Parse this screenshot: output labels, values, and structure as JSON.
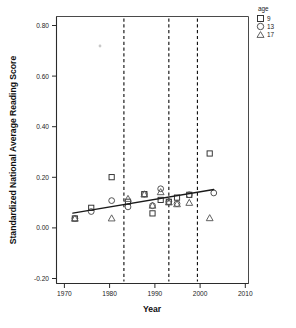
{
  "chart_data": {
    "type": "scatter",
    "title": "",
    "xlabel": "Year",
    "ylabel": "Standardized National Average Reading Score",
    "xlim": [
      1966.5,
      2013.5
    ],
    "ylim": [
      -0.28,
      0.87
    ],
    "xticks": [
      1970,
      1980,
      1990,
      2000,
      2010
    ],
    "xtick_labels": [
      "1970",
      "1980",
      "1990",
      "2000",
      "2010"
    ],
    "yticks": [
      -0.2,
      0.0,
      0.2,
      0.4,
      0.6,
      0.8
    ],
    "ytick_labels": [
      "-0.20",
      "0.00",
      "0.20",
      "0.40",
      "0.60",
      "0.80"
    ],
    "grid": false,
    "legend": {
      "title": "age",
      "position": "top-right-outside",
      "entries": [
        {
          "label": "9",
          "marker": "square"
        },
        {
          "label": "13",
          "marker": "circle"
        },
        {
          "label": "17",
          "marker": "triangle"
        }
      ]
    },
    "reference_lines": {
      "orientation": "vertical",
      "style": "dashed",
      "x": [
        1983,
        1994,
        2001
      ]
    },
    "trend_line": {
      "type": "linear-fit",
      "x": [
        1970.5,
        2005.0
      ],
      "y": [
        0.023,
        0.125
      ]
    },
    "series": [
      {
        "name": "9",
        "marker": "square",
        "points": [
          {
            "x": 1971,
            "y": 0.0
          },
          {
            "x": 1975,
            "y": 0.046
          },
          {
            "x": 1980,
            "y": 0.178
          },
          {
            "x": 1984,
            "y": 0.072
          },
          {
            "x": 1988,
            "y": 0.105
          },
          {
            "x": 1990,
            "y": 0.022
          },
          {
            "x": 1992,
            "y": 0.08
          },
          {
            "x": 1994,
            "y": 0.072
          },
          {
            "x": 1996,
            "y": 0.09
          },
          {
            "x": 1999,
            "y": 0.102
          },
          {
            "x": 2004,
            "y": 0.28
          }
        ]
      },
      {
        "name": "13",
        "marker": "circle",
        "points": [
          {
            "x": 1971,
            "y": 0.0
          },
          {
            "x": 1975,
            "y": 0.03
          },
          {
            "x": 1980,
            "y": 0.077
          },
          {
            "x": 1984,
            "y": 0.05
          },
          {
            "x": 1988,
            "y": 0.105
          },
          {
            "x": 1990,
            "y": 0.055
          },
          {
            "x": 1992,
            "y": 0.128
          },
          {
            "x": 1994,
            "y": 0.072
          },
          {
            "x": 1996,
            "y": 0.064
          },
          {
            "x": 1999,
            "y": 0.102
          },
          {
            "x": 2005,
            "y": 0.11
          }
        ]
      },
      {
        "name": "17",
        "marker": "triangle",
        "points": [
          {
            "x": 1971,
            "y": 0.0
          },
          {
            "x": 1980,
            "y": 0.001
          },
          {
            "x": 1984,
            "y": 0.085
          },
          {
            "x": 1988,
            "y": 0.104
          },
          {
            "x": 1990,
            "y": 0.056
          },
          {
            "x": 1992,
            "y": 0.114
          },
          {
            "x": 1994,
            "y": 0.07
          },
          {
            "x": 1996,
            "y": 0.062
          },
          {
            "x": 1999,
            "y": 0.068
          },
          {
            "x": 2004,
            "y": 0.002
          }
        ]
      }
    ]
  }
}
